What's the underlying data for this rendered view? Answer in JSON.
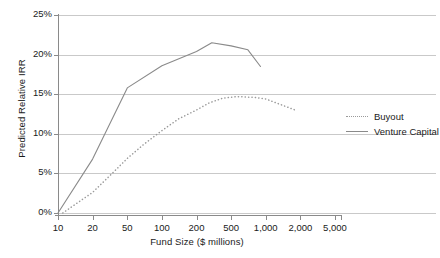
{
  "chart_data": {
    "type": "line",
    "title": "",
    "xlabel": "Fund Size ($ millions)",
    "ylabel": "Predicted Relative IRR",
    "x_scale": "log",
    "x_tick_labels": [
      "10",
      "20",
      "50",
      "100",
      "200",
      "500",
      "1,000",
      "2,000",
      "5,000"
    ],
    "x_tick_values": [
      10,
      20,
      50,
      100,
      200,
      500,
      1000,
      2000,
      5000
    ],
    "y_tick_labels": [
      "0%",
      "5%",
      "10%",
      "15%",
      "20%",
      "25%"
    ],
    "y_tick_values": [
      0,
      5,
      10,
      15,
      20,
      25
    ],
    "ylim": [
      0,
      25
    ],
    "grid": "horizontal",
    "legend_position": "right",
    "series": [
      {
        "name": "Buyout",
        "style": "dotted",
        "color": "#9a9a9a",
        "x": [
          11,
          20,
          35,
          50,
          70,
          100,
          140,
          200,
          280,
          400,
          560,
          800,
          1000,
          1400,
          1800
        ],
        "values": [
          0.0,
          2.6,
          5.2,
          6.9,
          8.7,
          10.4,
          11.9,
          13.0,
          13.9,
          14.5,
          14.7,
          14.6,
          14.4,
          13.6,
          13.0
        ]
      },
      {
        "name": "Venture Capital",
        "style": "solid",
        "color": "#8a8a8a",
        "x": [
          10,
          20,
          50,
          100,
          200,
          300,
          500,
          700,
          900
        ],
        "values": [
          0.0,
          6.8,
          15.8,
          18.6,
          20.4,
          21.5,
          21.1,
          20.6,
          18.5
        ]
      }
    ],
    "legend": [
      {
        "label": "Buyout",
        "style": "dotted"
      },
      {
        "label": "Venture Capital",
        "style": "solid"
      }
    ],
    "colors": {
      "grid": "#c9c9c9",
      "axis": "#8a8a8a",
      "buyout": "#9a9a9a",
      "venture_capital": "#8a8a8a",
      "text": "#1a1a1a"
    }
  }
}
